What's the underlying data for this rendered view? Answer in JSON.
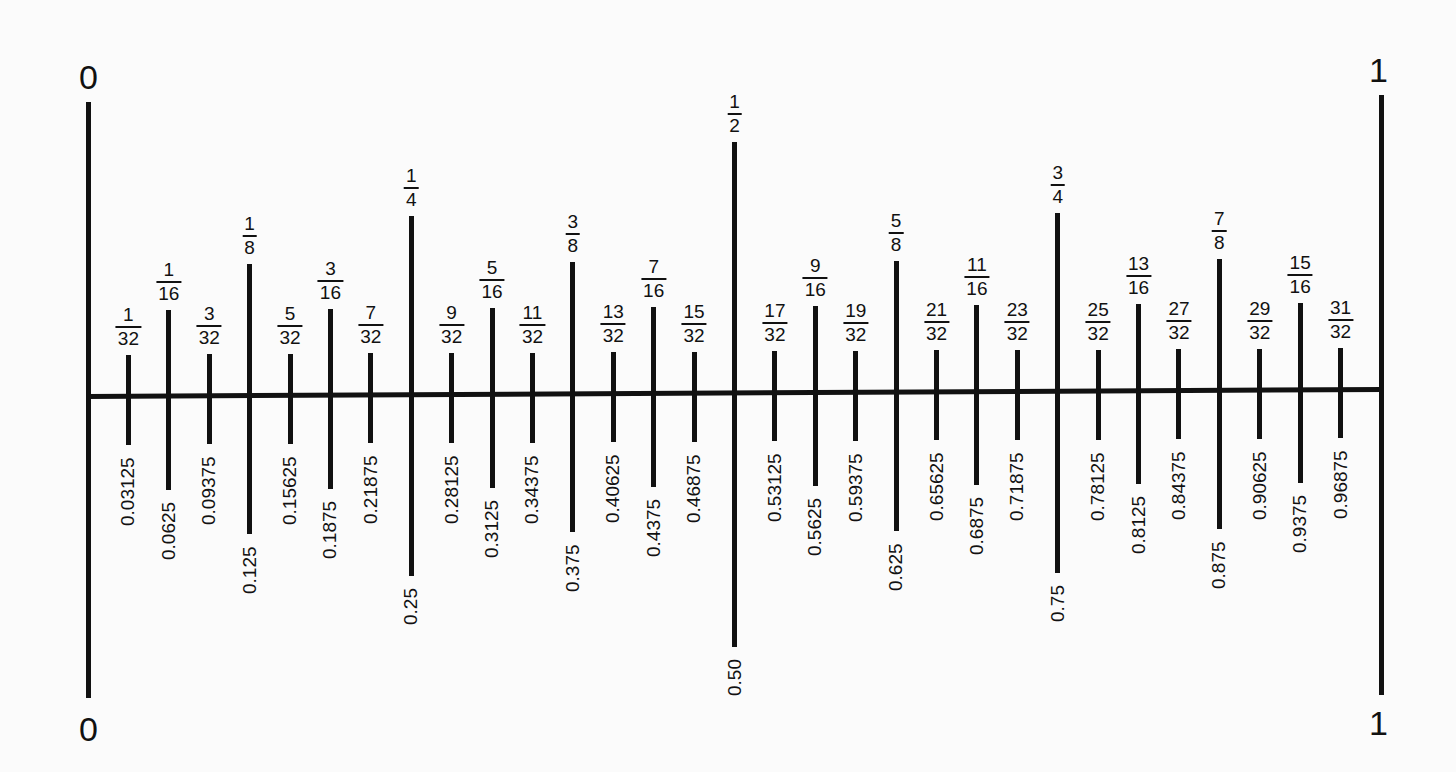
{
  "ruler": {
    "start_label": "0",
    "end_label": "1",
    "ticks": [
      {
        "num": "1",
        "den": "32",
        "dec": "0.03125",
        "level": 5
      },
      {
        "num": "1",
        "den": "16",
        "dec": "0.0625",
        "level": 4
      },
      {
        "num": "3",
        "den": "32",
        "dec": "0.09375",
        "level": 5
      },
      {
        "num": "1",
        "den": "8",
        "dec": "0.125",
        "level": 3
      },
      {
        "num": "5",
        "den": "32",
        "dec": "0.15625",
        "level": 5
      },
      {
        "num": "3",
        "den": "16",
        "dec": "0.1875",
        "level": 4
      },
      {
        "num": "7",
        "den": "32",
        "dec": "0.21875",
        "level": 5
      },
      {
        "num": "1",
        "den": "4",
        "dec": "0.25",
        "level": 2
      },
      {
        "num": "9",
        "den": "32",
        "dec": "0.28125",
        "level": 5
      },
      {
        "num": "5",
        "den": "16",
        "dec": "0.3125",
        "level": 4
      },
      {
        "num": "11",
        "den": "32",
        "dec": "0.34375",
        "level": 5
      },
      {
        "num": "3",
        "den": "8",
        "dec": "0.375",
        "level": 3
      },
      {
        "num": "13",
        "den": "32",
        "dec": "0.40625",
        "level": 5
      },
      {
        "num": "7",
        "den": "16",
        "dec": "0.4375",
        "level": 4
      },
      {
        "num": "15",
        "den": "32",
        "dec": "0.46875",
        "level": 5
      },
      {
        "num": "1",
        "den": "2",
        "dec": "0.50",
        "level": 1
      },
      {
        "num": "17",
        "den": "32",
        "dec": "0.53125",
        "level": 5
      },
      {
        "num": "9",
        "den": "16",
        "dec": "0.5625",
        "level": 4
      },
      {
        "num": "19",
        "den": "32",
        "dec": "0.59375",
        "level": 5
      },
      {
        "num": "5",
        "den": "8",
        "dec": "0.625",
        "level": 3
      },
      {
        "num": "21",
        "den": "32",
        "dec": "0.65625",
        "level": 5
      },
      {
        "num": "11",
        "den": "16",
        "dec": "0.6875",
        "level": 4
      },
      {
        "num": "23",
        "den": "32",
        "dec": "0.71875",
        "level": 5
      },
      {
        "num": "3",
        "den": "4",
        "dec": "0.75",
        "level": 2
      },
      {
        "num": "25",
        "den": "32",
        "dec": "0.78125",
        "level": 5
      },
      {
        "num": "13",
        "den": "16",
        "dec": "0.8125",
        "level": 4
      },
      {
        "num": "27",
        "den": "32",
        "dec": "0.84375",
        "level": 5
      },
      {
        "num": "7",
        "den": "8",
        "dec": "0.875",
        "level": 3
      },
      {
        "num": "29",
        "den": "32",
        "dec": "0.90625",
        "level": 5
      },
      {
        "num": "15",
        "den": "16",
        "dec": "0.9375",
        "level": 4
      },
      {
        "num": "31",
        "den": "32",
        "dec": "0.96875",
        "level": 5
      }
    ]
  }
}
